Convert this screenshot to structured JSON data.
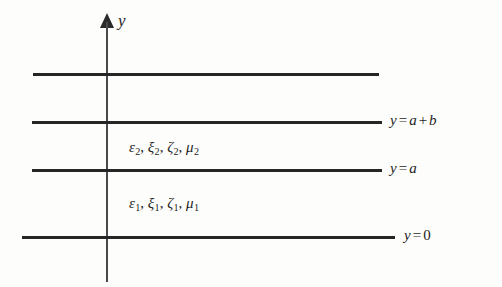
{
  "figure": {
    "type": "layered-media-geometry-diagram",
    "background_color": "#fdfdfc",
    "line_color": "#262626",
    "axis_color": "#4a4a4a",
    "text_color": "#1d1d1d"
  },
  "axis": {
    "label": "y",
    "arrow_direction": "up"
  },
  "interfaces": [
    {
      "id": "top-boundary",
      "label": "",
      "y_px": 73,
      "x_start_px": 33,
      "x_end_px": 379
    },
    {
      "id": "y-equals-a-plus-b",
      "label_parts": {
        "lhs": "y",
        "eq": "=",
        "rhs1": "a",
        "plus": "+",
        "rhs2": "b"
      },
      "label_text": "y = a + b",
      "y_px": 121,
      "x_start_px": 32,
      "x_end_px": 382
    },
    {
      "id": "y-equals-a",
      "label_parts": {
        "lhs": "y",
        "eq": "=",
        "rhs1": "a"
      },
      "label_text": "y = a",
      "y_px": 169,
      "x_start_px": 32,
      "x_end_px": 382
    },
    {
      "id": "y-equals-0",
      "label_parts": {
        "lhs": "y",
        "eq": "=",
        "rhs1": "0"
      },
      "label_text": "y = 0",
      "y_px": 236,
      "x_start_px": 22,
      "x_end_px": 395
    }
  ],
  "media": [
    {
      "id": "layer-2",
      "region": "between y = a and y = a + b",
      "parameters": [
        {
          "symbol": "ε",
          "subscript": "2"
        },
        {
          "symbol": "ξ",
          "subscript": "2"
        },
        {
          "symbol": "ζ",
          "subscript": "2"
        },
        {
          "symbol": "μ",
          "subscript": "2"
        }
      ],
      "text": "ε2, ξ2, ζ2, μ2"
    },
    {
      "id": "layer-1",
      "region": "between y = 0 and y = a",
      "parameters": [
        {
          "symbol": "ε",
          "subscript": "1"
        },
        {
          "symbol": "ξ",
          "subscript": "1"
        },
        {
          "symbol": "ζ",
          "subscript": "1"
        },
        {
          "symbol": "μ",
          "subscript": "1"
        }
      ],
      "text": "ε1, ξ1, ζ1, μ1"
    }
  ],
  "separators": {
    "comma": ", "
  }
}
